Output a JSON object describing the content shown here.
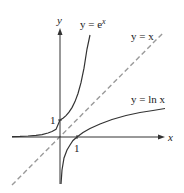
{
  "figure": {
    "axes": {
      "x_label": "x",
      "y_label": "y",
      "x_tick_label": "1",
      "y_tick_label": "1"
    },
    "curves": [
      {
        "id": "exp",
        "label": "y = e",
        "label_sup": "x",
        "style": "solid",
        "color": "#333333"
      },
      {
        "id": "identity",
        "label": "y = x",
        "style": "dashed",
        "color": "#999999"
      },
      {
        "id": "ln",
        "label": "y = ln x",
        "style": "solid",
        "color": "#333333"
      }
    ]
  }
}
